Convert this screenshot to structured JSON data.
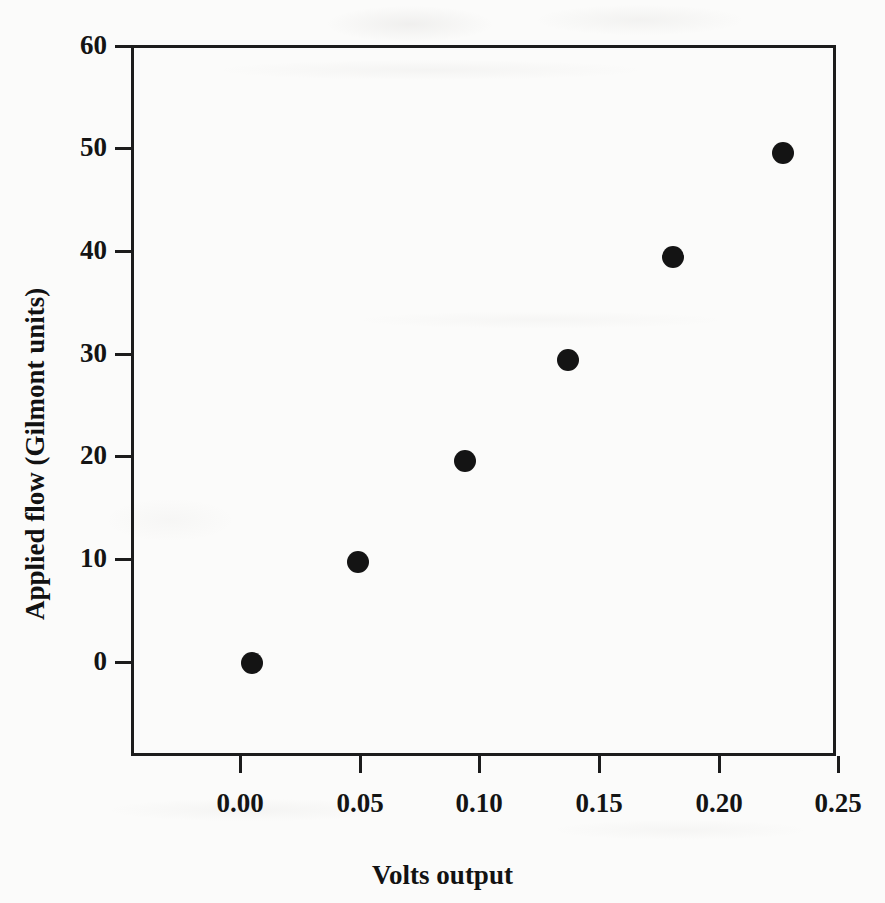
{
  "figure": {
    "background_color": "#fbfbfa",
    "ink_color": "#141414"
  },
  "chart_data": {
    "type": "scatter",
    "title": "",
    "xlabel": "Volts output",
    "ylabel": "Applied flow (Gilmont units)",
    "xlim": [
      -0.0125,
      0.2583
    ],
    "ylim": [
      -9.0,
      60.0
    ],
    "xticks": [
      0.0,
      0.05,
      0.1,
      0.15,
      0.2,
      0.25
    ],
    "xtick_labels": [
      "0.00",
      "0.05",
      "0.10",
      "0.15",
      "0.20",
      "0.25"
    ],
    "yticks": [
      0,
      10,
      20,
      30,
      40,
      50,
      60
    ],
    "ytick_labels": [
      "0",
      "10",
      "20",
      "30",
      "40",
      "50",
      "60"
    ],
    "grid": false,
    "legend": null,
    "marker": {
      "shape": "circle",
      "filled": true,
      "color": "#141414",
      "size_px": 22
    },
    "x": [
      0.005,
      0.049,
      0.094,
      0.137,
      0.181,
      0.227
    ],
    "y": [
      0.0,
      9.8,
      19.6,
      29.5,
      39.5,
      49.6
    ],
    "points": [
      {
        "x": 0.005,
        "y": 0.0
      },
      {
        "x": 0.049,
        "y": 9.8
      },
      {
        "x": 0.094,
        "y": 19.6
      },
      {
        "x": 0.137,
        "y": 29.5
      },
      {
        "x": 0.181,
        "y": 39.5
      },
      {
        "x": 0.227,
        "y": 49.6
      }
    ]
  }
}
